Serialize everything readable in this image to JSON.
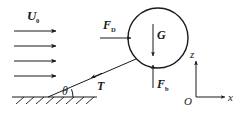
{
  "figure": {
    "background_color": "#ffffff",
    "ink_color": "#1a1a1a",
    "width": 239,
    "height": 121
  },
  "labels": {
    "inflow_velocity": "U",
    "inflow_velocity_sub": "0",
    "drag_force": "F",
    "drag_force_sub": "D",
    "gravity": "G",
    "buoyancy": "F",
    "buoyancy_sub": "b",
    "tension": "T",
    "angle": "θ",
    "axis_x": "x",
    "axis_z": "z",
    "origin": "O"
  },
  "flow": {
    "arrow_count": 4,
    "direction": "right",
    "arrow_x_start": 14,
    "arrow_x_end": 56,
    "arrow_rows_y": [
      31,
      46,
      61,
      76
    ]
  },
  "sphere": {
    "center_x": 158,
    "center_y": 38,
    "radius": 30
  },
  "tether": {
    "anchor_x": 48,
    "anchor_y": 97,
    "attach_x": 136,
    "attach_y": 59,
    "angle_label_position": {
      "x": 66,
      "y": 93
    },
    "arrowhead_direction": "down-left"
  },
  "ground": {
    "line_x_start": 12,
    "line_x_end": 97,
    "line_y": 97,
    "hatch_count": 8
  },
  "axes": {
    "origin_x": 196,
    "origin_y": 97,
    "x_axis_end": 226,
    "z_axis_top": 60
  },
  "force_vectors": [
    {
      "name": "drag-force",
      "label_key": "drag_force",
      "direction": "right",
      "x1": 100,
      "y1": 38,
      "x2": 131,
      "y2": 38
    },
    {
      "name": "gravity-force",
      "label_key": "gravity",
      "direction": "down",
      "x1": 153,
      "y1": 24,
      "x2": 153,
      "y2": 56
    },
    {
      "name": "buoyancy-force",
      "label_key": "buoyancy",
      "direction": "up",
      "x1": 153,
      "y1": 88,
      "x2": 153,
      "y2": 66
    },
    {
      "name": "tension-force",
      "label_key": "tension",
      "direction": "down-left",
      "x1": 136,
      "y1": 59,
      "x2": 48,
      "y2": 97
    }
  ]
}
